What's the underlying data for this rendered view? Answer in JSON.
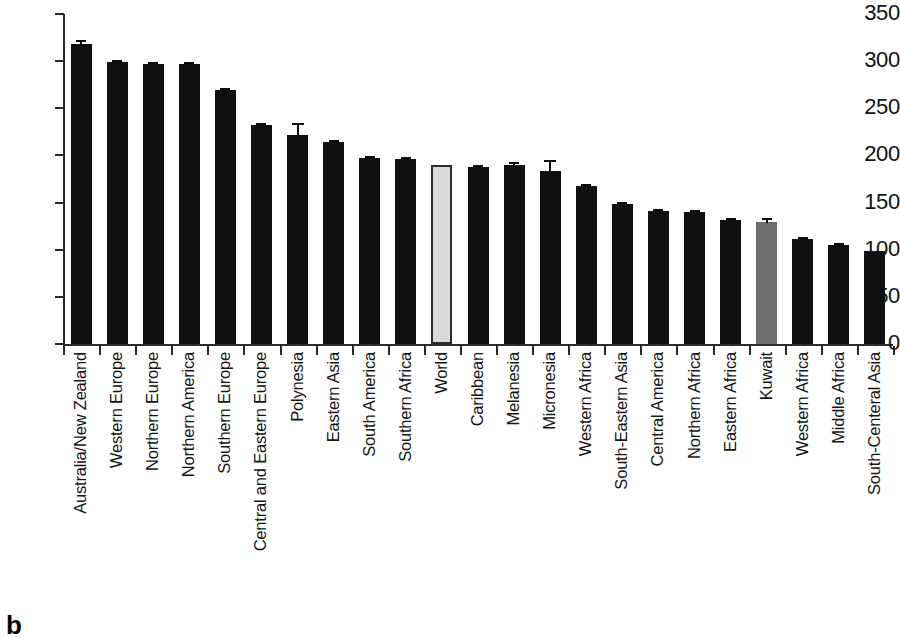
{
  "figure": {
    "panel_label": "b",
    "background": "#ffffff"
  },
  "chart_data": {
    "type": "bar",
    "title": "",
    "xlabel": "",
    "ylabel": "",
    "ylim": [
      0,
      350
    ],
    "yticks": [
      0,
      50,
      100,
      150,
      200,
      250,
      300,
      350
    ],
    "grid": false,
    "legend": null,
    "categories": [
      "Australia/New Zealand",
      "Western Europe",
      "Northern Europe",
      "Northern America",
      "Southern Europe",
      "Central and Eastern Europe",
      "Polynesia",
      "Eastern Asia",
      "South America",
      "Southern Africa",
      "World",
      "Caribbean",
      "Melanesia",
      "Micronesia",
      "Western Africa",
      "South-Eastern Asia",
      "Central America",
      "Northern Africa",
      "Eastern Africa",
      "Kuwait",
      "Western Africa",
      "Middle Africa",
      "South-Centeral Asia"
    ],
    "values": [
      318,
      299,
      297,
      297,
      269,
      232,
      222,
      214,
      197,
      196,
      190,
      188,
      190,
      184,
      168,
      148,
      141,
      140,
      132,
      129,
      111,
      105,
      99
    ],
    "errors": [
      4,
      2,
      2,
      2,
      2,
      2,
      12,
      2,
      2,
      2,
      0,
      2,
      3,
      11,
      2,
      2,
      2,
      2,
      2,
      4,
      2,
      2,
      0
    ],
    "bar_colors": [
      "#101010",
      "#101010",
      "#101010",
      "#101010",
      "#101010",
      "#101010",
      "#101010",
      "#101010",
      "#101010",
      "#101010",
      "#d9d9d9",
      "#101010",
      "#101010",
      "#101010",
      "#101010",
      "#101010",
      "#101010",
      "#101010",
      "#101010",
      "#6e6e6e",
      "#101010",
      "#101010",
      "#101010"
    ],
    "highlight_colors": {
      "dark_bar": "#101010",
      "world_bar": "#d9d9d9",
      "kuwait_bar": "#6e6e6e",
      "axis": "#2b2b2b"
    }
  }
}
